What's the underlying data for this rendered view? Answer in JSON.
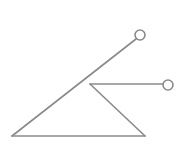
{
  "diagram": {
    "stroke_color": "#8a8a8a",
    "background": "#ffffff",
    "stroke_width": 1.6,
    "segments": [
      {
        "name": "long-diagonal-line",
        "x1": 12,
        "y1": 136,
        "x2": 136,
        "y2": 39
      },
      {
        "name": "base-line",
        "x1": 12,
        "y1": 136,
        "x2": 145,
        "y2": 136
      },
      {
        "name": "inner-diagonal-line",
        "x1": 90,
        "y1": 84,
        "x2": 145,
        "y2": 136
      },
      {
        "name": "horizontal-arm-line",
        "x1": 90,
        "y1": 84,
        "x2": 163,
        "y2": 84
      }
    ],
    "endpoints": [
      {
        "name": "upper-endpoint-circle",
        "cx": 140,
        "cy": 35,
        "r": 5
      },
      {
        "name": "right-endpoint-circle",
        "cx": 168,
        "cy": 85,
        "r": 5
      }
    ]
  }
}
